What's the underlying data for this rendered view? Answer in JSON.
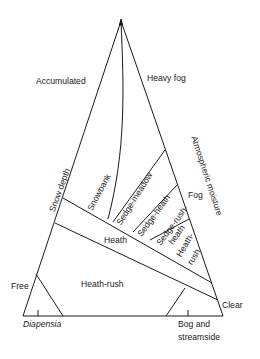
{
  "diagram": {
    "type": "ternary-vegetation-diagram",
    "apex": "top",
    "corner_labels": {
      "top_left": "Accumulated",
      "top_right": "Heavy fog",
      "bottom_left": "Free",
      "bottom_right": "Clear"
    },
    "axis_labels": {
      "left": "Snow depth",
      "right": "Atmospheric moisture"
    },
    "side_label": "Fog",
    "regions": [
      {
        "name": "Snowbank"
      },
      {
        "name": "Sedge-meadow"
      },
      {
        "name": "Sedge-heath"
      },
      {
        "name": "Sedge-rush-heath",
        "line1": "Sedge-rush-",
        "line2": "heath"
      },
      {
        "name": "Heath-rush",
        "line1": "Heath-",
        "line2": "rush"
      },
      {
        "name": "Heath"
      },
      {
        "name": "Heath-rush"
      }
    ],
    "base_labels": {
      "left": "Diapensia",
      "right_line1": "Bog and",
      "right_line2": "streamside"
    },
    "colors": {
      "line": "#1a1a1a",
      "background": "#ffffff"
    }
  }
}
